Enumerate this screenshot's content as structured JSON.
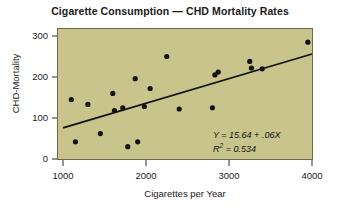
{
  "chart_data": {
    "type": "scatter",
    "title": "Cigarette Consumption — CHD Mortality Rates",
    "xlabel": "Cigarettes per Year",
    "ylabel": "CHD-Mortality",
    "xlim": [
      800,
      4100
    ],
    "ylim": [
      0,
      330
    ],
    "xticks": [
      1000,
      2000,
      3000,
      4000
    ],
    "yticks": [
      0,
      100,
      200,
      300
    ],
    "xtick_labels": [
      "1000",
      "2000",
      "3000",
      "4000"
    ],
    "ytick_labels": [
      "0",
      "100",
      "200",
      "300"
    ],
    "grid": false,
    "legend": null,
    "background_color": "#c8c48b",
    "point_color": "#121212",
    "line_color": "#121212",
    "points": [
      {
        "x": 1100,
        "y": 145
      },
      {
        "x": 1150,
        "y": 42
      },
      {
        "x": 1300,
        "y": 133
      },
      {
        "x": 1450,
        "y": 62
      },
      {
        "x": 1600,
        "y": 160
      },
      {
        "x": 1620,
        "y": 118
      },
      {
        "x": 1720,
        "y": 125
      },
      {
        "x": 1780,
        "y": 30
      },
      {
        "x": 1870,
        "y": 196
      },
      {
        "x": 1900,
        "y": 42
      },
      {
        "x": 1980,
        "y": 128
      },
      {
        "x": 2050,
        "y": 172
      },
      {
        "x": 2250,
        "y": 250
      },
      {
        "x": 2400,
        "y": 122
      },
      {
        "x": 2800,
        "y": 125
      },
      {
        "x": 2830,
        "y": 205
      },
      {
        "x": 2870,
        "y": 212
      },
      {
        "x": 3250,
        "y": 238
      },
      {
        "x": 3270,
        "y": 222
      },
      {
        "x": 3400,
        "y": 220
      },
      {
        "x": 3950,
        "y": 285
      }
    ],
    "regression_line": {
      "equation_label": "Y = 15.64 + .06X",
      "r_squared_label": "R² = 0.534",
      "intercept": 15.64,
      "slope": 0.06,
      "r_squared": 0.534,
      "x_start": 1000,
      "x_end": 4000,
      "y_start": 76,
      "y_end": 256
    },
    "annotations": [
      {
        "text": "Y = 15.64 + .06X"
      },
      {
        "text": "R² = 0.534"
      }
    ]
  },
  "annotation": {
    "equation_prefix": "Y",
    "equation_body": " = 15.64 + .06",
    "equation_var": "X",
    "r_letter": "R",
    "r_exp": "2",
    "r_value": " = 0.534"
  }
}
